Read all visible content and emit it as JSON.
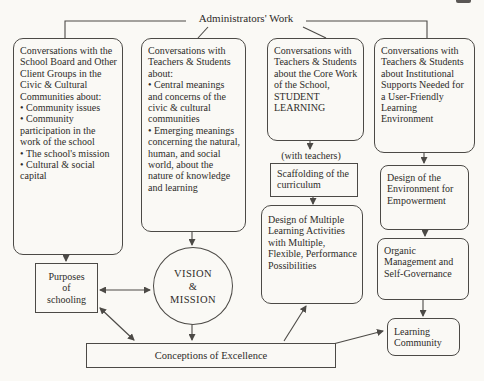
{
  "page": {
    "title": "Administrators' Work"
  },
  "boxes": {
    "school_board": {
      "intro": "Conversations with the School Board and Other Client Groups in the Civic & Cultural Communities about:",
      "bullets": [
        "Community issues",
        "Community participation in the work of the school",
        "The school's mission",
        "Cultural & social capital"
      ]
    },
    "teachers_meanings": {
      "intro": "Conversations with Teachers & Students about:",
      "bullets": [
        "Central meanings and concerns of the civic & cultural communities",
        "Emerging meanings concerning the natural, human, and social world, about the nature of knowledge and learning"
      ]
    },
    "core_work": {
      "text": "Conversations with Teachers & Students about the Core Work of the School, STUDENT LEARNING"
    },
    "institutional": {
      "text": "Conversations with Teachers & Students about Institutional Supports Needed for a User-Friendly Learning Environment"
    },
    "with_teachers_label": "(with teachers)",
    "scaffolding": "Scaffolding of the curriculum",
    "design_learning": "Design of Multiple Learning Activities with Multiple, Flexible, Performance Possibilities",
    "design_environment": "Design of the Environment for Empowerment",
    "organic_management": "Organic Management and Self-Governance",
    "learning_community": "Learning Community",
    "purposes": {
      "line1": "Purposes",
      "line2": "of",
      "line3": "schooling"
    },
    "vision_mission": {
      "line1": "VISION",
      "line2": "&",
      "line3": "MISSION"
    },
    "conceptions": "Conceptions of Excellence"
  },
  "colors": {
    "paper": "#faf9f5",
    "ink": "#2e2c29",
    "line": "#4c4a46"
  }
}
